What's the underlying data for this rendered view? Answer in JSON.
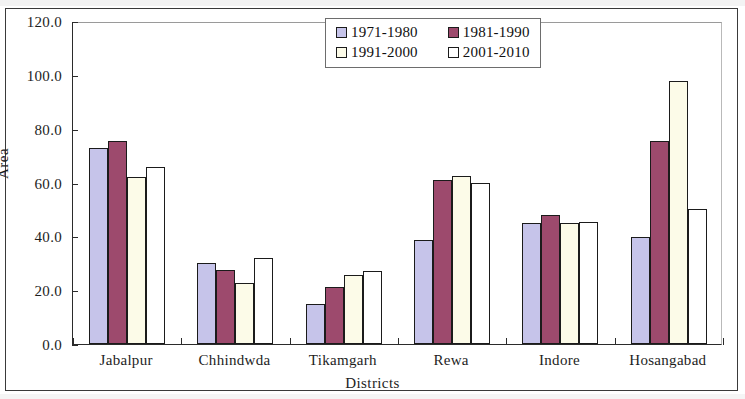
{
  "chart_data": {
    "type": "bar",
    "title": "",
    "xlabel": "Districts",
    "ylabel": "Area",
    "ylim": [
      0,
      120
    ],
    "ytick_labels": [
      "0.0",
      "20.0",
      "40.0",
      "60.0",
      "80.0",
      "100.0",
      "120.0"
    ],
    "ytick_values": [
      0,
      20,
      40,
      60,
      80,
      100,
      120
    ],
    "grid": false,
    "legend_position": "top-right-inside",
    "categories": [
      "Jabalpur",
      "Chhindwda",
      "Tikamgarh",
      "Rewa",
      "Indore",
      "Hosangabad"
    ],
    "series": [
      {
        "name": "1971-1980",
        "color": "#c6c4ea",
        "values": [
          72.8,
          30.0,
          14.8,
          38.5,
          44.8,
          39.8
        ]
      },
      {
        "name": "1981-1990",
        "color": "#9d4a6d",
        "values": [
          75.5,
          27.6,
          21.1,
          61.1,
          48.0,
          75.6
        ]
      },
      {
        "name": "1991-2000",
        "color": "#fcfbe8",
        "values": [
          62.2,
          22.8,
          25.7,
          62.4,
          44.9,
          97.6
        ]
      },
      {
        "name": "2001-2010",
        "color": "#ffffff",
        "values": [
          65.6,
          32.0,
          27.3,
          59.9,
          45.3,
          50.0
        ]
      }
    ]
  },
  "axis": {
    "y_title": "Area",
    "x_title": "Districts"
  }
}
